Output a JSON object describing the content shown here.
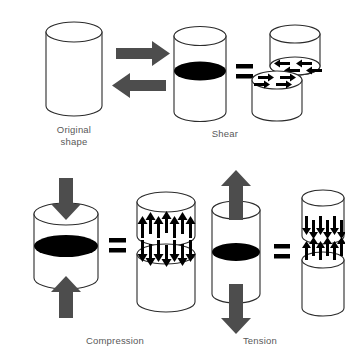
{
  "figure": {
    "background_color": "#ffffff",
    "caption_color": "#595959",
    "outline_color": "#2b2b2b",
    "gray_arrow_color": "#4d4d4d",
    "black_color": "#000000"
  },
  "panels": [
    {
      "id": "original",
      "label": "Original\nshape",
      "description": "Plain upright cylinder with no applied stress",
      "applied_arrows": [],
      "equals_sign": false,
      "split": false
    },
    {
      "id": "shear",
      "label": "Shear",
      "description": "Opposing horizontal forces offset the two halves sideways",
      "applied_arrows": [
        {
          "direction": "right",
          "position": "upper-left",
          "color": "#4d4d4d"
        },
        {
          "direction": "left",
          "position": "lower-left",
          "color": "#4d4d4d"
        }
      ],
      "equals_sign": true,
      "split": true,
      "split_offset": "diagonal",
      "face_arrows": {
        "upper_face": {
          "direction": "left",
          "count": 4,
          "color": "#000000"
        },
        "lower_face": {
          "direction": "right",
          "count": 4,
          "color": "#000000"
        }
      }
    },
    {
      "id": "compression",
      "label": "Compression",
      "description": "Forces push inward from top and bottom, shortening the cylinder",
      "applied_arrows": [
        {
          "direction": "down",
          "position": "top",
          "color": "#4d4d4d"
        },
        {
          "direction": "up",
          "position": "bottom",
          "color": "#4d4d4d"
        }
      ],
      "equals_sign": true,
      "split": true,
      "split_offset": "vertical",
      "face_arrows": {
        "upper_block": {
          "direction": "up",
          "count": 9,
          "color": "#000000"
        },
        "lower_block": {
          "direction": "down",
          "count": 9,
          "color": "#000000"
        }
      }
    },
    {
      "id": "tension",
      "label": "Tension",
      "description": "Forces pull outward from top and bottom, stretching the cylinder",
      "applied_arrows": [
        {
          "direction": "up",
          "position": "top",
          "color": "#4d4d4d"
        },
        {
          "direction": "down",
          "position": "bottom",
          "color": "#4d4d4d"
        }
      ],
      "equals_sign": true,
      "split": true,
      "split_offset": "vertical",
      "face_arrows": {
        "upper_block": {
          "direction": "down",
          "count": 9,
          "color": "#000000"
        },
        "lower_block": {
          "direction": "up",
          "count": 9,
          "color": "#000000"
        }
      }
    }
  ],
  "equals_symbol": "="
}
